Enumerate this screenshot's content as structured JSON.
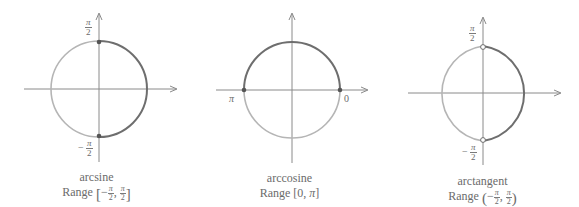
{
  "colors": {
    "axis": "#8a8a8a",
    "circle_light": "#b5b5b5",
    "circle_dark": "#6e6e6e",
    "point": "#555555",
    "text": "#6a6a6a"
  },
  "panels": [
    {
      "id": "arcsine",
      "name": "arcsine",
      "range_label": "Range",
      "range_open": "[",
      "range_close": "]",
      "range_lower_sign": "−",
      "range_lower_num": "π",
      "range_lower_den": "2",
      "range_sep": ",",
      "range_upper_num": "π",
      "range_upper_den": "2",
      "highlight": "right-half",
      "endpoints": "closed",
      "labels": {
        "top_num": "π",
        "top_den": "2",
        "bottom_sign": "−",
        "bottom_num": "π",
        "bottom_den": "2"
      }
    },
    {
      "id": "arccosine",
      "name": "arccosine",
      "range_text": "Range [0, ",
      "range_pi": "π",
      "range_end": "]",
      "highlight": "top-half",
      "endpoints": "closed",
      "labels": {
        "left": "π",
        "right": "0"
      }
    },
    {
      "id": "arctangent",
      "name": "arctangent",
      "range_label": "Range",
      "range_open": "(",
      "range_close": ")",
      "range_lower_sign": "−",
      "range_lower_num": "π",
      "range_lower_den": "2",
      "range_sep": ",",
      "range_upper_num": "π",
      "range_upper_den": "2",
      "highlight": "right-half",
      "endpoints": "open",
      "labels": {
        "top_num": "π",
        "top_den": "2",
        "bottom_sign": "−",
        "bottom_num": "π",
        "bottom_den": "2"
      }
    }
  ]
}
